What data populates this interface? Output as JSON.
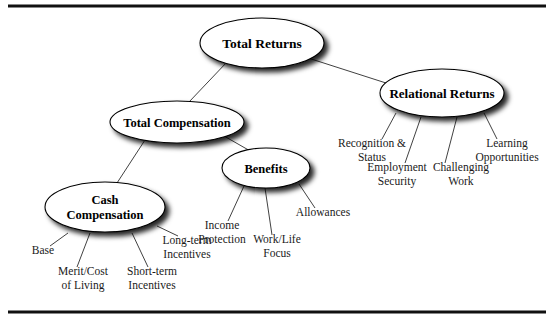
{
  "diagram": {
    "type": "hierarchy-tree",
    "frame": {
      "top_rule": true,
      "bottom_rule": true,
      "color": "#111111"
    },
    "style": {
      "node_fill": "#ffffff",
      "node_stroke": "#000000",
      "shadow_color": "#000000",
      "connector_color": "#2b2b2b",
      "text_color": "#000000"
    },
    "nodes": [
      {
        "id": "total-returns",
        "label": "Total Returns",
        "lines": [
          "Total Returns"
        ],
        "cx": 262,
        "cy": 43,
        "rx": 62,
        "ry": 25,
        "font_size": 13.5
      },
      {
        "id": "total-compensation",
        "label": "Total Compensation",
        "lines": [
          "Total Compensation"
        ],
        "cx": 177,
        "cy": 122,
        "rx": 67,
        "ry": 21,
        "font_size": 12.5
      },
      {
        "id": "relational-returns",
        "label": "Relational Returns",
        "lines": [
          "Relational Returns"
        ],
        "cx": 442,
        "cy": 93,
        "rx": 62,
        "ry": 24,
        "font_size": 13
      },
      {
        "id": "cash-compensation",
        "label": "Cash Compensation",
        "lines": [
          "Cash",
          "Compensation"
        ],
        "cx": 105,
        "cy": 207,
        "rx": 60,
        "ry": 25,
        "font_size": 12.5
      },
      {
        "id": "benefits",
        "label": "Benefits",
        "lines": [
          "Benefits"
        ],
        "cx": 266,
        "cy": 168,
        "rx": 44,
        "ry": 20,
        "font_size": 12.5
      }
    ],
    "leaves": [
      {
        "id": "base",
        "parent": "cash-compensation",
        "lines": [
          "Base"
        ],
        "x": 43,
        "y": 254,
        "font_size": 11.5,
        "line_from": [
          68,
          233
        ],
        "line_to": [
          50,
          246
        ]
      },
      {
        "id": "merit-cost-of-living",
        "parent": "cash-compensation",
        "lines": [
          "Merit/Cost",
          "of Living"
        ],
        "x": 83,
        "y": 275,
        "font_size": 11.5,
        "line_from": [
          90,
          233
        ],
        "line_to": [
          77,
          267
        ]
      },
      {
        "id": "short-term-incentives",
        "parent": "cash-compensation",
        "lines": [
          "Short-term",
          "Incentives"
        ],
        "x": 152,
        "y": 275,
        "font_size": 11.5,
        "line_from": [
          132,
          233
        ],
        "line_to": [
          148,
          267
        ]
      },
      {
        "id": "long-term-incentives",
        "parent": "cash-compensation",
        "lines": [
          "Long-term",
          "Incentives"
        ],
        "x": 187,
        "y": 244,
        "font_size": 11.5,
        "line_from": [
          157,
          226
        ],
        "line_to": [
          178,
          236
        ]
      },
      {
        "id": "income-protection",
        "parent": "benefits",
        "lines": [
          "Income",
          "Protection"
        ],
        "x": 222,
        "y": 229,
        "font_size": 11.5,
        "line_from": [
          244,
          186
        ],
        "line_to": [
          228,
          221
        ]
      },
      {
        "id": "work-life-focus",
        "parent": "benefits",
        "lines": [
          "Work/Life",
          "Focus"
        ],
        "x": 277,
        "y": 243,
        "font_size": 11.5,
        "line_from": [
          265,
          188
        ],
        "line_to": [
          272,
          235
        ]
      },
      {
        "id": "allowances",
        "parent": "benefits",
        "lines": [
          "Allowances"
        ],
        "x": 323,
        "y": 216,
        "font_size": 11.5,
        "line_from": [
          299,
          184
        ],
        "line_to": [
          315,
          208
        ]
      },
      {
        "id": "recognition-status",
        "parent": "relational-returns",
        "lines": [
          "Recognition &",
          "Status"
        ],
        "x": 372,
        "y": 147,
        "font_size": 11.5,
        "line_from": [
          396,
          113
        ],
        "line_to": [
          382,
          139
        ]
      },
      {
        "id": "employment-security",
        "parent": "relational-returns",
        "lines": [
          "Employment",
          "Security"
        ],
        "x": 397,
        "y": 171,
        "font_size": 11.5,
        "line_from": [
          421,
          117
        ],
        "line_to": [
          405,
          163
        ]
      },
      {
        "id": "challenging-work",
        "parent": "relational-returns",
        "lines": [
          "Challenging",
          "Work"
        ],
        "x": 461,
        "y": 171,
        "font_size": 11.5,
        "line_from": [
          457,
          117
        ],
        "line_to": [
          445,
          163
        ]
      },
      {
        "id": "learning-opportunities",
        "parent": "relational-returns",
        "lines": [
          "Learning",
          "Opportunities"
        ],
        "x": 507,
        "y": 147,
        "font_size": 11.5,
        "line_from": [
          484,
          113
        ],
        "line_to": [
          497,
          139
        ]
      }
    ],
    "edges": [
      {
        "id": "edge-total-returns-total-compensation",
        "from": "total-returns",
        "to": "total-compensation",
        "x1": 227,
        "y1": 62,
        "x2": 189,
        "y2": 102
      },
      {
        "id": "edge-total-returns-relational-returns",
        "from": "total-returns",
        "to": "relational-returns",
        "x1": 305,
        "y1": 57,
        "x2": 386,
        "y2": 83
      },
      {
        "id": "edge-total-compensation-cash-compensation",
        "from": "total-compensation",
        "to": "cash-compensation",
        "x1": 145,
        "y1": 140,
        "x2": 117,
        "y2": 183
      },
      {
        "id": "edge-total-compensation-benefits",
        "from": "total-compensation",
        "to": "benefits",
        "x1": 224,
        "y1": 136,
        "x2": 252,
        "y2": 152
      }
    ]
  }
}
